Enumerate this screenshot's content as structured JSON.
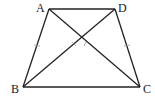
{
  "diagram": {
    "type": "trapezoid-with-diagonals",
    "points": {
      "A": {
        "label": "A",
        "x": 49,
        "y": 9
      },
      "D": {
        "label": "D",
        "x": 115,
        "y": 9
      },
      "B": {
        "label": "B",
        "x": 23,
        "y": 87
      },
      "C": {
        "label": "C",
        "x": 140,
        "y": 87
      }
    },
    "segments": [
      "AD",
      "BC",
      "AB",
      "DC",
      "AC",
      "BD"
    ],
    "equal_marks": [
      "AB",
      "DC"
    ],
    "line_color": "#222222"
  }
}
